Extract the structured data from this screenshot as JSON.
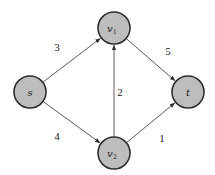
{
  "diagram": {
    "type": "directed-weighted-graph",
    "colors": {
      "node_fill": "#bdbdbd",
      "node_stroke": "#2e2e2e",
      "edge": "#4a4a4a",
      "background": "#ffffff"
    },
    "nodes": [
      {
        "id": "s",
        "label": "s",
        "sub": "",
        "cx": 30,
        "cy": 92
      },
      {
        "id": "v1",
        "label": "v",
        "sub": "1",
        "cx": 114,
        "cy": 28
      },
      {
        "id": "v2",
        "label": "v",
        "sub": "2",
        "cx": 114,
        "cy": 153
      },
      {
        "id": "t",
        "label": "t",
        "sub": "",
        "cx": 188,
        "cy": 92
      }
    ],
    "node_radius": 16,
    "edges": [
      {
        "from": "s",
        "to": "v1",
        "weight": "3",
        "label_x": 57,
        "label_y": 51
      },
      {
        "from": "v1",
        "to": "t",
        "weight": "5",
        "label_x": 168,
        "label_y": 55
      },
      {
        "from": "v2",
        "to": "v1",
        "weight": "2",
        "label_x": 120,
        "label_y": 96
      },
      {
        "from": "s",
        "to": "v2",
        "weight": "4",
        "label_x": 57,
        "label_y": 140
      },
      {
        "from": "v2",
        "to": "t",
        "weight": "1",
        "label_x": 162,
        "label_y": 142
      }
    ]
  }
}
